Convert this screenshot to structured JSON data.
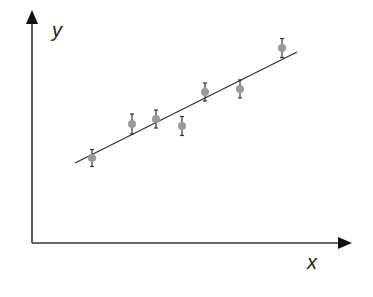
{
  "chart_data": {
    "type": "scatter",
    "title": "",
    "xlabel": "x",
    "ylabel": "y",
    "grid": false,
    "legend": null,
    "ticks": false,
    "axis_style": "arrows-no-ticks",
    "xlim": [
      0,
      318
    ],
    "ylim": [
      0,
      231
    ],
    "series": [
      {
        "name": "measurements",
        "kind": "points-with-error-bars",
        "marker_color": "#9a9a9a",
        "x": [
          60,
          100,
          124,
          150,
          173,
          208,
          250
        ],
        "y": [
          85,
          119,
          124,
          117,
          151,
          154,
          195
        ],
        "error": [
          8.5,
          10,
          9,
          9.5,
          9,
          9,
          9.5
        ]
      },
      {
        "name": "linear fit",
        "kind": "line",
        "line_color": "#333333",
        "x": [
          43,
          265
        ],
        "y": [
          80,
          191
        ]
      }
    ]
  },
  "colors": {
    "axis": "#111111",
    "fit_line": "#333333",
    "marker": "#9a9a9a",
    "error_bar": "#333333",
    "background": "#ffffff"
  },
  "labels": {
    "x_axis": "x",
    "y_axis": "y"
  }
}
